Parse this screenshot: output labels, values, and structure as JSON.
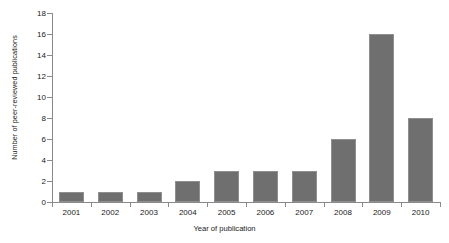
{
  "chart_data": {
    "type": "bar",
    "title": "",
    "xlabel": "Year of publication",
    "ylabel": "Number of peer-reviewed publications",
    "categories": [
      "2001",
      "2002",
      "2003",
      "2004",
      "2005",
      "2006",
      "2007",
      "2008",
      "2009",
      "2010"
    ],
    "values": [
      1,
      1,
      1,
      2,
      3,
      3,
      3,
      6,
      16,
      8
    ],
    "ylim": [
      0,
      18
    ],
    "ytick_values": [
      0,
      2,
      4,
      6,
      8,
      10,
      12,
      14,
      16,
      18
    ],
    "ytick_labels": [
      "0",
      "2",
      "4",
      "6",
      "8",
      "10",
      "12",
      "14",
      "16",
      "18"
    ],
    "grid": false,
    "legend": null,
    "legend_position": "none",
    "bar_color": "#6f6f6f",
    "bar_edge_color": "#8f8f8f",
    "axis_color": "#8a8a8a",
    "background_color": "#ffffff"
  }
}
